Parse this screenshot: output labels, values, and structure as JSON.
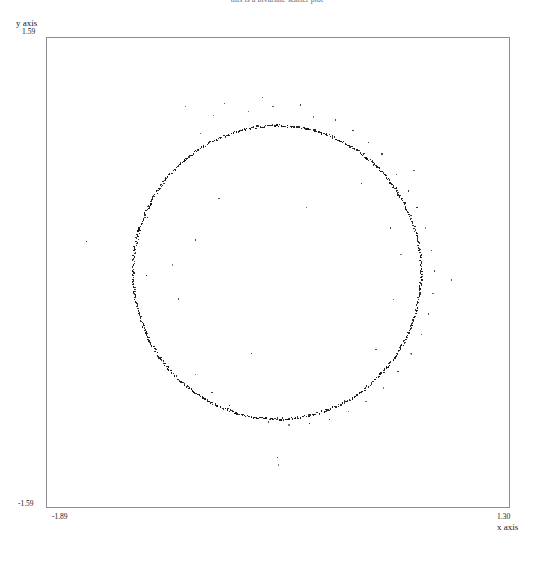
{
  "figure": {
    "title": "this is a bivariate scatter plot",
    "background_color": "#ffffff",
    "frame_color": "#8d8d93",
    "point_color": "#111111"
  },
  "axes": {
    "y_axis_name": "y axis",
    "y_max_label": "1.59",
    "y_min_label": "-1.59",
    "x_axis_name": "x axis",
    "x_min_label": "-1.89",
    "x_max_label": "1.30"
  },
  "chart_data": {
    "type": "scatter",
    "title": "this is a bivariate scatter plot",
    "xlabel": "x axis",
    "ylabel": "y axis",
    "xlim": [
      -1.89,
      1.3
    ],
    "ylim": [
      -1.59,
      1.59
    ],
    "grid": false,
    "legend": false,
    "ring": {
      "center_x": -0.3,
      "center_y": 0.0,
      "radius": 0.99,
      "n_points": 620,
      "radial_jitter": 0.008
    },
    "outliers": [
      [
        -1.61,
        0.21
      ],
      [
        -1.28,
        0.0
      ],
      [
        -1.2,
        -0.02
      ],
      [
        -1.19,
        0.37
      ],
      [
        -0.93,
        1.12
      ],
      [
        -0.83,
        0.94
      ],
      [
        -0.74,
        1.06
      ],
      [
        -0.66,
        1.14
      ],
      [
        -0.5,
        1.09
      ],
      [
        -0.4,
        1.18
      ],
      [
        -0.33,
        1.12
      ],
      [
        -0.24,
        1.07
      ],
      [
        -0.14,
        1.13
      ],
      [
        -0.05,
        1.05
      ],
      [
        0.1,
        1.03
      ],
      [
        0.22,
        0.96
      ],
      [
        0.33,
        0.88
      ],
      [
        0.42,
        0.8
      ],
      [
        0.52,
        0.66
      ],
      [
        0.6,
        0.55
      ],
      [
        0.66,
        0.44
      ],
      [
        0.72,
        0.3
      ],
      [
        0.76,
        0.15
      ],
      [
        0.78,
        0.01
      ],
      [
        0.77,
        -0.14
      ],
      [
        0.74,
        -0.28
      ],
      [
        0.69,
        -0.42
      ],
      [
        0.62,
        -0.55
      ],
      [
        0.53,
        -0.67
      ],
      [
        0.43,
        -0.78
      ],
      [
        0.31,
        -0.87
      ],
      [
        0.19,
        -0.94
      ],
      [
        0.06,
        -0.99
      ],
      [
        -0.08,
        -1.02
      ],
      [
        -0.22,
        -1.03
      ],
      [
        -0.36,
        -1.01
      ],
      [
        -0.5,
        -0.97
      ],
      [
        -0.63,
        -0.9
      ],
      [
        -0.75,
        -0.81
      ],
      [
        -0.86,
        -0.69
      ],
      [
        -0.29,
        -1.3
      ],
      [
        -0.3,
        -1.25
      ],
      [
        -0.48,
        -0.55
      ],
      [
        -0.1,
        0.44
      ],
      [
        0.48,
        0.3
      ],
      [
        0.55,
        0.12
      ],
      [
        0.5,
        -0.18
      ],
      [
        0.28,
        0.6
      ],
      [
        -1.02,
        0.05
      ],
      [
        -0.98,
        -0.18
      ],
      [
        0.86,
        0.26
      ],
      [
        0.9,
        -0.05
      ],
      [
        0.64,
        0.69
      ],
      [
        0.38,
        -0.52
      ],
      [
        -0.7,
        0.5
      ],
      [
        -0.86,
        0.22
      ]
    ]
  }
}
